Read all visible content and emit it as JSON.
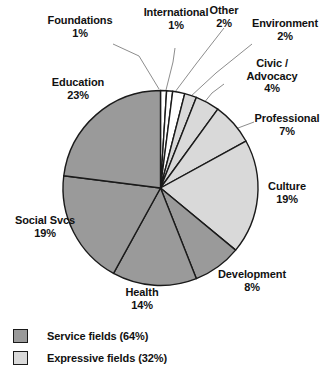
{
  "chart_data": {
    "type": "pie",
    "title": "",
    "total_label": "",
    "categories": [
      "Foundations",
      "International",
      "Other",
      "Environment",
      "Civic /\nAdvocacy",
      "Professional",
      "Culture",
      "Development",
      "Health",
      "Social Svcs",
      "Education"
    ],
    "values": [
      1,
      1,
      2,
      2,
      4,
      7,
      19,
      8,
      14,
      19,
      23
    ],
    "value_labels": [
      "1%",
      "1%",
      "2%",
      "2%",
      "4%",
      "7%",
      "19%",
      "8%",
      "14%",
      "19%",
      "23%"
    ],
    "slices": [
      {
        "label": "Foundations",
        "value": 1,
        "value_label": "1%",
        "group": "other",
        "fill": "#ffffff"
      },
      {
        "label": "International",
        "value": 1,
        "value_label": "1%",
        "group": "other",
        "fill": "#ffffff"
      },
      {
        "label": "Other",
        "value": 2,
        "value_label": "2%",
        "group": "other",
        "fill": "#ffffff"
      },
      {
        "label": "Environment",
        "value": 2,
        "value_label": "2%",
        "group": "expressive",
        "fill": "#d9d9d9"
      },
      {
        "label": "Civic /\nAdvocacy",
        "value": 4,
        "value_label": "4%",
        "group": "expressive",
        "fill": "#d9d9d9"
      },
      {
        "label": "Professional",
        "value": 7,
        "value_label": "7%",
        "group": "expressive",
        "fill": "#d9d9d9"
      },
      {
        "label": "Culture",
        "value": 19,
        "value_label": "19%",
        "group": "expressive",
        "fill": "#d9d9d9"
      },
      {
        "label": "Development",
        "value": 8,
        "value_label": "8%",
        "group": "service",
        "fill": "#9a9a9a"
      },
      {
        "label": "Health",
        "value": 14,
        "value_label": "14%",
        "group": "service",
        "fill": "#9a9a9a"
      },
      {
        "label": "Social Svcs",
        "value": 19,
        "value_label": "19%",
        "group": "service",
        "fill": "#9a9a9a"
      },
      {
        "label": "Education",
        "value": 23,
        "value_label": "23%",
        "group": "service",
        "fill": "#9a9a9a"
      }
    ],
    "legend": {
      "position": "bottom-left",
      "entries": [
        {
          "label": "Service fields (64%)",
          "color": "#9a9a9a"
        },
        {
          "label": "Expressive fields (32%)",
          "color": "#d9d9d9"
        }
      ]
    },
    "colors": {
      "service": "#9a9a9a",
      "expressive": "#d9d9d9",
      "other": "#ffffff",
      "outline": "#1a1a1a",
      "leader": "#888888",
      "text": "#111111"
    },
    "geometry": {
      "center_x": 160.5,
      "center_y": 188,
      "radius": 97.5,
      "start_angle_deg": 0,
      "direction": "clockwise"
    }
  },
  "labels": {
    "foundations": {
      "name": "Foundations",
      "pct": "1%"
    },
    "international": {
      "name": "International",
      "pct": "1%"
    },
    "other": {
      "name": "Other",
      "pct": "2%"
    },
    "environment": {
      "name": "Environment",
      "pct": "2%"
    },
    "civic": {
      "name": "Civic /\nAdvocacy",
      "pct": "4%"
    },
    "professional": {
      "name": "Professional",
      "pct": "7%"
    },
    "culture": {
      "name": "Culture",
      "pct": "19%"
    },
    "development": {
      "name": "Development",
      "pct": "8%"
    },
    "health": {
      "name": "Health",
      "pct": "14%"
    },
    "social": {
      "name": "Social Svcs",
      "pct": "19%"
    },
    "education": {
      "name": "Education",
      "pct": "23%"
    }
  },
  "legend": {
    "service": "Service fields (64%)",
    "expressive": "Expressive fields (32%)"
  }
}
